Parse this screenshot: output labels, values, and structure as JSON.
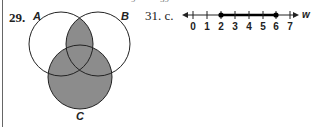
{
  "top_fragment": {
    "left": "9",
    "right": "39"
  },
  "problem_29": {
    "number": "29.",
    "sets": {
      "a": "A",
      "b": "B",
      "c": "C"
    },
    "shaded_regions": "(A ∩ B) ∪ C",
    "fill_color": "#8c8c8c"
  },
  "problem_31": {
    "number": "31. c.",
    "variable": "w",
    "ticks": [
      "0",
      "1",
      "2",
      "3",
      "4",
      "5",
      "6",
      "7"
    ],
    "closed_endpoints": [
      2,
      6
    ],
    "segment_color": "#000000"
  }
}
